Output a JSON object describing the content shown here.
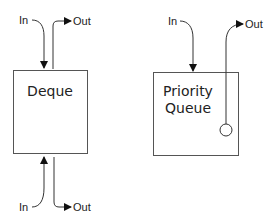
{
  "diagram": {
    "deque": {
      "title": "Deque",
      "top_in_label": "In",
      "top_out_label": "Out",
      "bottom_in_label": "In",
      "bottom_out_label": "Out"
    },
    "priority_queue": {
      "title_line1": "Priority",
      "title_line2": "Queue",
      "in_label": "In",
      "out_label": "Out"
    },
    "colors": {
      "stroke": "#333333",
      "background": "#ffffff"
    }
  }
}
